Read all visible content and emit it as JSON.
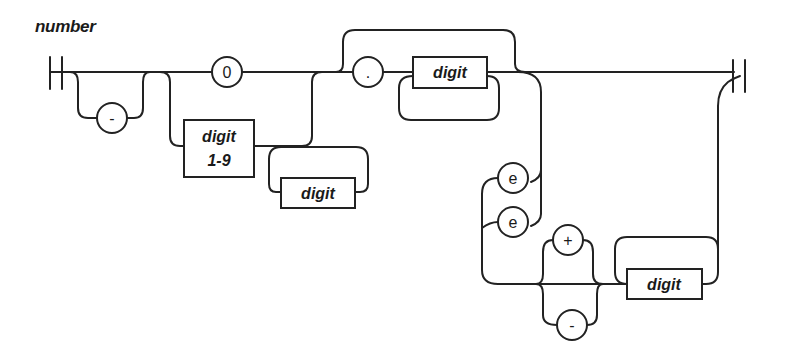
{
  "diagram": {
    "title": "number",
    "type": "railroad-syntax-diagram",
    "nodes": {
      "minus_sign": "-",
      "zero": "0",
      "digit_1_9_line1": "digit",
      "digit_1_9_line2": "1-9",
      "digit_repeat_int": "digit",
      "decimal_point": ".",
      "digit_fraction": "digit",
      "exp_e_lower": "e",
      "exp_e_upper": "e",
      "exp_plus": "+",
      "exp_minus": "-",
      "digit_exponent": "digit"
    },
    "colors": {
      "stroke": "#222222",
      "background": "#ffffff",
      "text": "#1a1a1a"
    }
  }
}
